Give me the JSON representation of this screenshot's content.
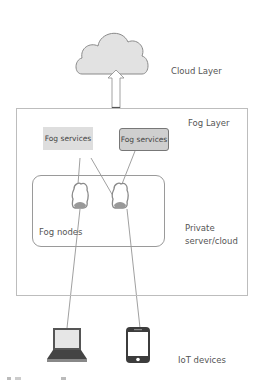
{
  "diagram": {
    "layers": {
      "cloud": {
        "label": "Cloud Layer"
      },
      "fog": {
        "label": "Fog Layer"
      },
      "private": {
        "label_line1": "Private",
        "label_line2": "server/cloud"
      },
      "iot": {
        "label": "IoT devices"
      }
    },
    "fog_services": [
      {
        "label": "Fog services",
        "fill": "#dedede",
        "border": "none"
      },
      {
        "label": "Fog services",
        "fill": "#cfcfcf",
        "border": "#777777"
      }
    ],
    "fog_nodes": {
      "label": "Fog nodes",
      "count": 2
    },
    "devices": [
      {
        "type": "laptop-icon"
      },
      {
        "type": "smartphone-icon"
      }
    ],
    "edges": [
      {
        "from": "fog-node-1",
        "to": "fog-services-1"
      },
      {
        "from": "fog-node-2",
        "to": "fog-services-1"
      },
      {
        "from": "fog-node-2",
        "to": "fog-services-2"
      },
      {
        "from": "laptop",
        "to": "fog-node-1"
      },
      {
        "from": "smartphone",
        "to": "fog-node-2"
      },
      {
        "from": "fog-layer",
        "to": "cloud",
        "style": "arrow"
      }
    ],
    "colors": {
      "cloud_fill": "#e2e2e2",
      "outline": "#8a8a8a",
      "text": "#555555"
    }
  }
}
